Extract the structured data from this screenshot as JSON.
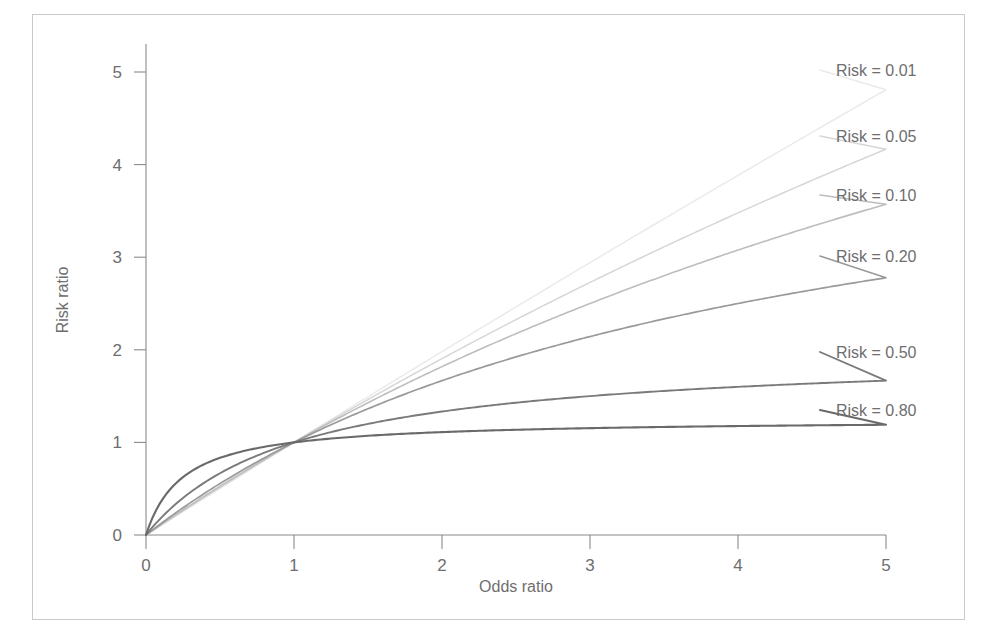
{
  "chart_data": {
    "type": "line",
    "title": "",
    "xlabel": "Odds ratio",
    "ylabel": "Risk ratio",
    "xlim": [
      0,
      5.35
    ],
    "ylim": [
      0,
      5.35
    ],
    "xticks": [
      "0",
      "1",
      "2",
      "3",
      "4",
      "5"
    ],
    "xtick_values": [
      0,
      1,
      2,
      3,
      4,
      5
    ],
    "yticks": [
      "0",
      "1",
      "2",
      "3",
      "4",
      "5"
    ],
    "ytick_values": [
      0,
      1,
      2,
      3,
      4,
      5
    ],
    "grid": false,
    "legend_position": "right-inline",
    "note": "Risk ratio as a function of odds ratio for differing baseline risks; RR = OR / (1 - R + R*OR). All curves pass through (1,1).",
    "x": [
      0,
      0.5,
      1,
      1.5,
      2,
      2.5,
      3,
      3.5,
      4,
      4.5,
      5
    ],
    "series": [
      {
        "name": "Risk = 0.01",
        "label": "Risk = 0.01",
        "risk": 0.01,
        "color": "#eaeaea",
        "values": [
          0,
          0.5025,
          1,
          1.4926,
          1.9802,
          2.4631,
          2.9412,
          3.4146,
          3.8835,
          4.3478,
          4.8077
        ],
        "end_value": 4.8077
      },
      {
        "name": "Risk = 0.05",
        "label": "Risk = 0.05",
        "risk": 0.05,
        "color": "#d6d6d6",
        "values": [
          0,
          0.5128,
          1,
          1.4634,
          1.9048,
          2.3256,
          2.7273,
          3.1111,
          3.4783,
          3.8298,
          4.1667
        ],
        "end_value": 4.1667
      },
      {
        "name": "Risk = 0.10",
        "label": "Risk = 0.10",
        "risk": 0.1,
        "color": "#bdbdbd",
        "values": [
          0,
          0.5263,
          1,
          1.4286,
          1.8182,
          2.1739,
          2.5,
          2.8,
          3.0769,
          3.3333,
          3.5714
        ],
        "end_value": 3.5714
      },
      {
        "name": "Risk = 0.20",
        "label": "Risk = 0.20",
        "risk": 0.2,
        "color": "#9a9a9a",
        "values": [
          0,
          0.5556,
          1,
          1.3636,
          1.6667,
          1.9231,
          2.1429,
          2.3333,
          2.5,
          2.6471,
          2.7778
        ],
        "end_value": 2.7778
      },
      {
        "name": "Risk = 0.50",
        "label": "Risk = 0.50",
        "risk": 0.5,
        "color": "#7a7a7a",
        "values": [
          0,
          0.6667,
          1,
          1.2,
          1.3333,
          1.4286,
          1.5,
          1.5556,
          1.6,
          1.6364,
          1.6667
        ],
        "end_value": 1.79
      },
      {
        "name": "Risk = 0.80",
        "label": "Risk = 0.80",
        "risk": 0.8,
        "color": "#6a6a6a",
        "values": [
          0,
          0.7813,
          1,
          1.0714,
          1.1111,
          1.1364,
          1.1538,
          1.1667,
          1.1765,
          1.1842,
          1.1905
        ],
        "end_value": 1.2195
      }
    ]
  }
}
